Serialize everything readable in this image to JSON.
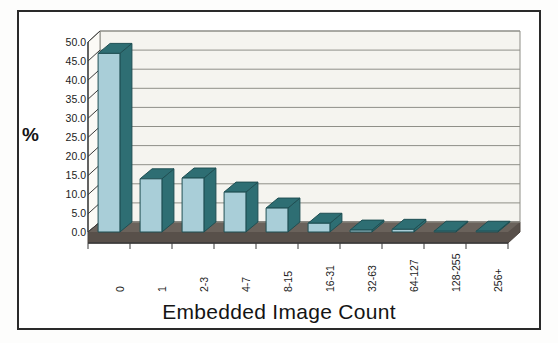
{
  "figure": {
    "background": "#ffffff",
    "frame_color": "#2a2a2a"
  },
  "axis": {
    "y_title": "%",
    "y_ticks": [
      "50.0",
      "45.0",
      "40.0",
      "35.0",
      "30.0",
      "25.0",
      "20.0",
      "15.0",
      "10.0",
      "5.0",
      "0.0"
    ],
    "x_title": "Embedded Image Count",
    "x_ticks": [
      "0",
      "1",
      "2-3",
      "4-7",
      "8-15",
      "16-31",
      "32-63",
      "64-127",
      "128-255",
      "256+"
    ]
  },
  "colors": {
    "bar_front": "#a9ced8",
    "bar_side": "#2e6e73",
    "bar_top": "#2e6e73",
    "floor": "#58504a",
    "wall": "#f5f4ef",
    "gridline": "#8f8f88",
    "axis_line": "#3a3a3a",
    "text": "#1b1b1b"
  },
  "chart_data": {
    "type": "bar",
    "title": "",
    "xlabel": "Embedded Image Count",
    "ylabel": "%",
    "ylim": [
      0,
      50
    ],
    "ytick_step": 5,
    "grid": true,
    "legend": "none",
    "three_d": true,
    "categories": [
      "0",
      "1",
      "2-3",
      "4-7",
      "8-15",
      "16-31",
      "32-63",
      "64-127",
      "128-255",
      "256+"
    ],
    "values": [
      47.0,
      14.0,
      14.2,
      10.5,
      6.3,
      2.3,
      0.5,
      0.7,
      0.2,
      0.2
    ]
  }
}
